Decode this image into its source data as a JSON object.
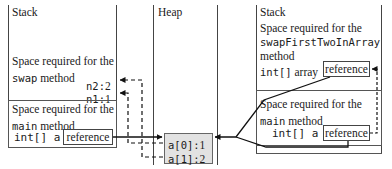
{
  "left_panel": {
    "title": "Stack",
    "swap_frame": {
      "line1": "Space required for the",
      "method_name": "swap",
      "method_suffix": " method",
      "vars": [
        {
          "label": "n2:",
          "value": "2"
        },
        {
          "label": "n1:",
          "value": "1"
        }
      ]
    },
    "main_frame": {
      "line1": "Space required for the",
      "method_name": "main",
      "method_suffix": " method",
      "var_decl": "int[] a",
      "ref_label": "reference"
    }
  },
  "heap_panel": {
    "title": "Heap",
    "array_cells": [
      {
        "label": "a[0]:",
        "value": "1"
      },
      {
        "label": "a[1]:",
        "value": "2"
      }
    ]
  },
  "right_panel": {
    "title": "Stack",
    "swap_frame": {
      "line1": "Space required for the",
      "method_name": "swapFirstTwoInArray",
      "method_suffix": "method",
      "var_type": "int[]",
      "var_name": " array",
      "ref_label": "reference"
    },
    "main_frame": {
      "line1": "Space required for the",
      "method_name": "main",
      "method_suffix": " method",
      "var_decl": "int[] a",
      "ref_label": "reference"
    }
  }
}
